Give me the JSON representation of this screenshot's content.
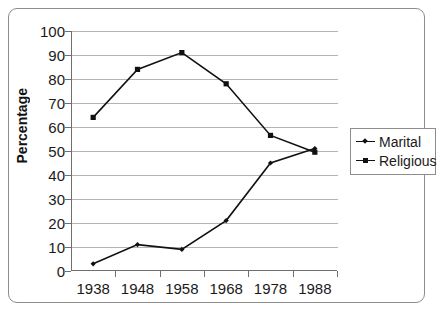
{
  "chart_data": {
    "type": "line",
    "title": "",
    "xlabel": "",
    "ylabel": "Percentage",
    "categories": [
      "1938",
      "1948",
      "1958",
      "1968",
      "1978",
      "1988"
    ],
    "x": [
      1938,
      1948,
      1958,
      1968,
      1978,
      1988
    ],
    "ylim": [
      0,
      100
    ],
    "ytick_step": 10,
    "yticks": [
      "100",
      "90",
      "80",
      "70",
      "60",
      "50",
      "40",
      "30",
      "20",
      "10",
      "0"
    ],
    "grid": "horizontal",
    "legend_position": "right",
    "series": [
      {
        "name": "Marital",
        "marker": "diamond",
        "color": "#111111",
        "values": [
          3,
          11,
          9,
          21,
          45,
          51
        ]
      },
      {
        "name": "Religious",
        "marker": "square",
        "color": "#111111",
        "values": [
          64,
          84,
          91,
          78,
          56.5,
          49.5
        ]
      }
    ]
  },
  "axis": {
    "y_title": "Percentage"
  },
  "legend": {
    "items": [
      {
        "label": "Marital"
      },
      {
        "label": "Religious"
      }
    ]
  },
  "colors": {
    "line": "#111111",
    "grid": "#b4b4b4",
    "axis": "#6f6f6f",
    "frame": "#8d8d8d",
    "background": "#ffffff"
  }
}
